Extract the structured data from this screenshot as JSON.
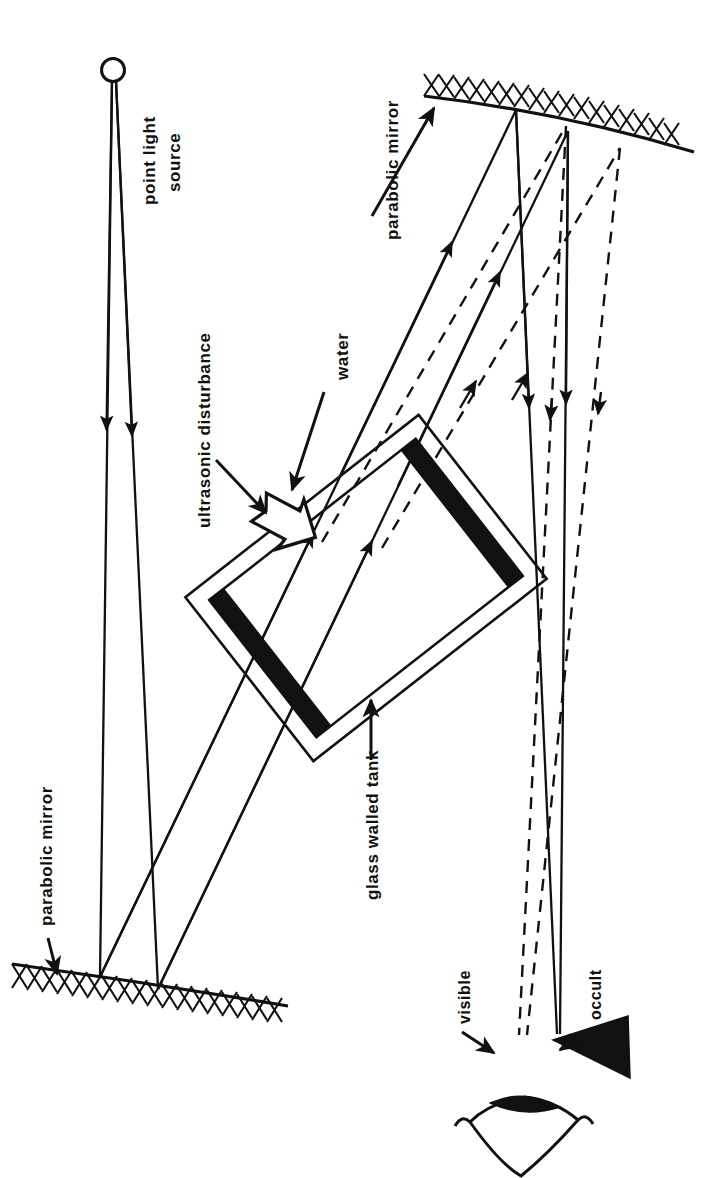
{
  "figure": {
    "kind": "optical-schlieren-diagram",
    "background_color": "#ffffff",
    "ink_color": "#111111",
    "width": 702,
    "height": 1178,
    "text_orientation": "rotated-90-ccw"
  },
  "labels": {
    "point_light_source_line1": "point light",
    "point_light_source_line2": "source",
    "parabolic_mirror_top": "parabolic mirror",
    "parabolic_mirror_bottom": "parabolic  mirror",
    "ultrasonic_disturbance": "ultrasonic  disturbance",
    "water": "water",
    "glass_walled_tank": "glass walled tank",
    "visible": "visible",
    "occult": "occult"
  },
  "components": [
    {
      "id": "point-light-source",
      "label": "point light source",
      "shape": "small-open-circle"
    },
    {
      "id": "parabolic-mirror-lower-left",
      "label": "parabolic  mirror",
      "shape": "curved-hatched-line"
    },
    {
      "id": "parabolic-mirror-upper-right",
      "label": "parabolic mirror",
      "shape": "curved-hatched-line"
    },
    {
      "id": "glass-walled-tank",
      "label": "glass walled tank",
      "shape": "rotated-rectangle-outline"
    },
    {
      "id": "transducer-bar-upper-left",
      "label": "",
      "shape": "filled-black-bar"
    },
    {
      "id": "transducer-bar-lower-right",
      "label": "",
      "shape": "filled-black-bar"
    },
    {
      "id": "ultrasonic-wave-arrow",
      "label": "ultrasonic  disturbance",
      "shape": "hollow-outline-arrow"
    },
    {
      "id": "occult-stop",
      "label": "occult",
      "shape": "filled-black-wedge"
    },
    {
      "id": "observer-eye",
      "label": "",
      "shape": "eye-outline-with-pupil"
    }
  ],
  "ray_legend": {
    "solid": "undiffracted light (direct rays)",
    "dashed": "diffracted light (visible rays)"
  }
}
